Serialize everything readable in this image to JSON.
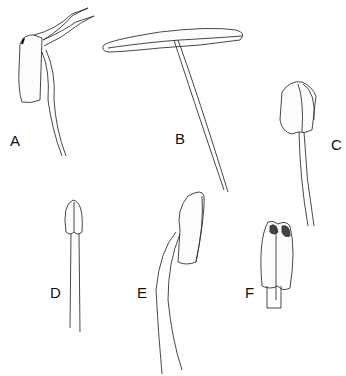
{
  "figure": {
    "type": "botanical line illustration",
    "panels": [
      {
        "label": "A",
        "x": 10,
        "y": 141
      },
      {
        "label": "B",
        "x": 175,
        "y": 138
      },
      {
        "label": "C",
        "x": 333,
        "y": 145
      },
      {
        "label": "D",
        "x": 50,
        "y": 292
      },
      {
        "label": "E",
        "x": 137,
        "y": 292
      },
      {
        "label": "F",
        "x": 245,
        "y": 292
      }
    ]
  }
}
